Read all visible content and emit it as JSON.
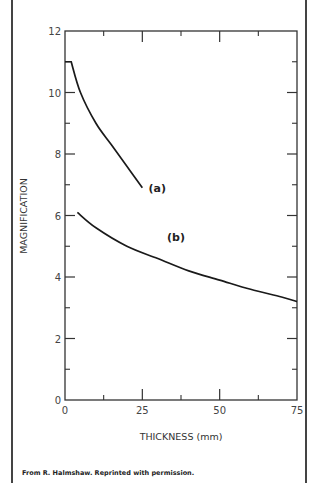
{
  "chart_data": {
    "type": "line",
    "title": "",
    "xlabel": "THICKNESS (mm)",
    "ylabel": "MAGNIFICATION",
    "xlim": [
      0,
      75
    ],
    "ylim": [
      0,
      12
    ],
    "x_ticks": [
      0,
      25,
      50,
      75
    ],
    "x_minor_ticks": [
      12.5,
      37.5,
      62.5
    ],
    "y_ticks": [
      0,
      2,
      4,
      6,
      8,
      10,
      12
    ],
    "y_minor_ticks": [
      1,
      3,
      5,
      7,
      9,
      11
    ],
    "grid": false,
    "legend": "inline labels",
    "series": [
      {
        "name": "(a)",
        "x": [
          0,
          2,
          5,
          10,
          15,
          20,
          25
        ],
        "values": [
          11.0,
          11.0,
          10.0,
          9.0,
          8.3,
          7.6,
          6.9
        ]
      },
      {
        "name": "(b)",
        "x": [
          4,
          10,
          20,
          30,
          40,
          50,
          60,
          70,
          75
        ],
        "values": [
          6.1,
          5.6,
          5.0,
          4.6,
          4.2,
          3.9,
          3.6,
          3.35,
          3.2
        ]
      }
    ],
    "annotations": [
      {
        "text": "(a)",
        "x": 27,
        "y": 6.9
      },
      {
        "text": "(b)",
        "x": 33,
        "y": 5.3
      }
    ]
  },
  "caption": "From R. Halmshaw. Reprinted with permission."
}
